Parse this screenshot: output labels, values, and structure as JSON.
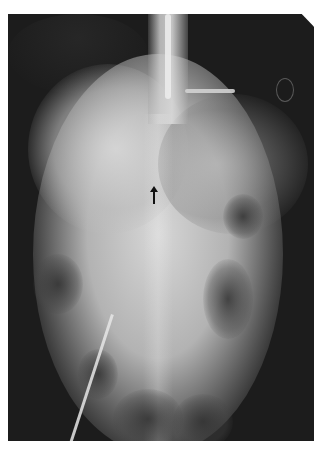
{
  "image": {
    "type": "abdominal radiograph",
    "annotation": {
      "arrow_direction": "up",
      "arrow_color": "#111111"
    },
    "colors": {
      "background": "#ffffff",
      "film_dark": "#1c1c1c",
      "soft_tissue_light": "#d8d8d8"
    }
  }
}
